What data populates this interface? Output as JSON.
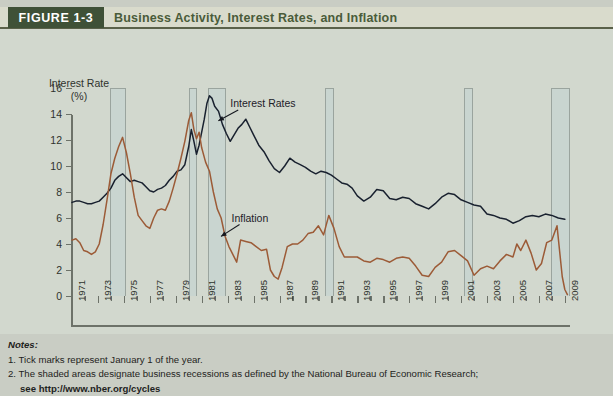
{
  "header": {
    "badge": "FIGURE 1-3",
    "title": "Business Activity, Interest Rates, and Inflation",
    "badge_bg": "#3f5137",
    "badge_fg": "#ffffff",
    "title_color": "#4a5c3a",
    "strip_bg": "#d9dbcc"
  },
  "chart_data": {
    "type": "line",
    "title": "Business Activity, Interest Rates, and Inflation",
    "xlabel": "",
    "ylabel": "Interest Rate (%)",
    "ylabel_line1": "Interest Rate",
    "ylabel_line2": "(%)",
    "ylim": [
      0,
      16
    ],
    "yticks": [
      0,
      2,
      4,
      6,
      8,
      10,
      12,
      14,
      16
    ],
    "xlim": [
      1971,
      2009.4
    ],
    "xticks": [
      1971,
      1972,
      1973,
      1974,
      1975,
      1976,
      1977,
      1978,
      1979,
      1980,
      1981,
      1982,
      1983,
      1984,
      1985,
      1986,
      1987,
      1988,
      1989,
      1990,
      1991,
      1992,
      1993,
      1994,
      1995,
      1996,
      1997,
      1998,
      1999,
      2000,
      2001,
      2002,
      2003,
      2004,
      2005,
      2006,
      2007,
      2008,
      2009
    ],
    "xticklabels": [
      "1971",
      "1973",
      "1975",
      "1977",
      "1979",
      "1981",
      "1983",
      "1985",
      "1987",
      "1989",
      "1991",
      "1993",
      "1995",
      "1997",
      "1999",
      "2001",
      "2003",
      "2005",
      "2007",
      "2009"
    ],
    "xticklabel_years": [
      1971,
      1973,
      1975,
      1977,
      1979,
      1981,
      1983,
      1985,
      1987,
      1989,
      1991,
      1993,
      1995,
      1997,
      1999,
      2001,
      2003,
      2005,
      2007,
      2009
    ],
    "grid": false,
    "legend": "annotations",
    "annotations": [
      {
        "label": "Interest Rates",
        "series": "interest_rates",
        "x_label": 1983.2,
        "y_label": 15.3,
        "x_point": 1981.9,
        "y_point": 13.1
      },
      {
        "label": "Inflation",
        "series": "inflation",
        "x_label": 1983.3,
        "y_label": 6.5,
        "x_point": 1982.1,
        "y_point": 4.2
      }
    ],
    "series": [
      {
        "name": "Interest Rates",
        "color": "#19212f",
        "x": [
          1971.0,
          1971.3,
          1971.6,
          1971.9,
          1972.2,
          1972.5,
          1972.8,
          1973.1,
          1973.4,
          1973.7,
          1974.0,
          1974.3,
          1974.6,
          1974.9,
          1975.2,
          1975.5,
          1975.8,
          1976.1,
          1976.4,
          1976.7,
          1977.0,
          1977.3,
          1977.6,
          1977.9,
          1978.2,
          1978.5,
          1978.8,
          1979.1,
          1979.4,
          1979.7,
          1980.0,
          1980.2,
          1980.4,
          1980.6,
          1980.8,
          1981.0,
          1981.2,
          1981.4,
          1981.6,
          1981.8,
          1982.0,
          1982.3,
          1982.6,
          1982.9,
          1983.2,
          1983.5,
          1983.8,
          1984.1,
          1984.4,
          1984.7,
          1985.0,
          1985.4,
          1985.8,
          1986.2,
          1986.6,
          1987.0,
          1987.4,
          1987.8,
          1988.2,
          1988.6,
          1989.0,
          1989.4,
          1989.8,
          1990.2,
          1990.6,
          1991.0,
          1991.4,
          1991.8,
          1992.2,
          1992.6,
          1993.0,
          1993.5,
          1994.0,
          1994.5,
          1995.0,
          1995.5,
          1996.0,
          1996.5,
          1997.0,
          1997.5,
          1998.0,
          1998.5,
          1999.0,
          1999.5,
          2000.0,
          2000.5,
          2001.0,
          2001.5,
          2002.0,
          2002.5,
          2003.0,
          2003.5,
          2004.0,
          2004.5,
          2005.0,
          2005.5,
          2006.0,
          2006.5,
          2007.0,
          2007.5,
          2008.0,
          2008.5,
          2009.0
        ],
        "y": [
          7.2,
          7.3,
          7.3,
          7.2,
          7.1,
          7.1,
          7.2,
          7.3,
          7.6,
          7.9,
          8.3,
          8.9,
          9.2,
          9.4,
          9.1,
          8.8,
          8.9,
          8.8,
          8.7,
          8.4,
          8.1,
          8.0,
          8.2,
          8.3,
          8.5,
          8.9,
          9.2,
          9.6,
          9.7,
          10.1,
          11.5,
          12.8,
          11.9,
          10.9,
          11.6,
          12.6,
          13.6,
          14.8,
          15.4,
          15.2,
          14.6,
          14.2,
          13.2,
          12.5,
          11.9,
          12.4,
          12.9,
          13.2,
          13.6,
          13.0,
          12.4,
          11.6,
          11.1,
          10.4,
          9.8,
          9.5,
          10.0,
          10.6,
          10.3,
          10.1,
          9.9,
          9.6,
          9.4,
          9.6,
          9.5,
          9.3,
          9.0,
          8.7,
          8.6,
          8.3,
          7.7,
          7.3,
          7.6,
          8.2,
          8.1,
          7.5,
          7.4,
          7.6,
          7.5,
          7.1,
          6.9,
          6.7,
          7.1,
          7.6,
          7.9,
          7.8,
          7.4,
          7.2,
          7.0,
          6.9,
          6.3,
          6.2,
          6.0,
          5.9,
          5.6,
          5.8,
          6.1,
          6.2,
          6.1,
          6.3,
          6.2,
          6.0,
          5.9
        ],
        "unit": "%"
      },
      {
        "name": "Inflation",
        "color": "#9c5b37",
        "x": [
          1971.0,
          1971.3,
          1971.6,
          1971.9,
          1972.2,
          1972.5,
          1972.8,
          1973.1,
          1973.4,
          1973.7,
          1974.0,
          1974.3,
          1974.6,
          1974.9,
          1975.2,
          1975.5,
          1975.8,
          1976.1,
          1976.4,
          1976.7,
          1977.0,
          1977.3,
          1977.6,
          1977.9,
          1978.2,
          1978.5,
          1978.8,
          1979.1,
          1979.4,
          1979.7,
          1980.0,
          1980.2,
          1980.4,
          1980.6,
          1980.8,
          1981.0,
          1981.3,
          1981.6,
          1981.9,
          1982.2,
          1982.5,
          1982.8,
          1983.1,
          1983.4,
          1983.7,
          1984.0,
          1984.4,
          1984.8,
          1985.2,
          1985.6,
          1986.0,
          1986.3,
          1986.6,
          1986.9,
          1987.2,
          1987.6,
          1988.0,
          1988.4,
          1988.8,
          1989.2,
          1989.6,
          1990.0,
          1990.4,
          1990.8,
          1991.2,
          1991.6,
          1992.0,
          1992.5,
          1993.0,
          1993.5,
          1994.0,
          1994.5,
          1995.0,
          1995.5,
          1996.0,
          1996.5,
          1997.0,
          1997.5,
          1998.0,
          1998.5,
          1999.0,
          1999.5,
          2000.0,
          2000.5,
          2001.0,
          2001.5,
          2002.0,
          2002.5,
          2003.0,
          2003.5,
          2004.0,
          2004.5,
          2005.0,
          2005.3,
          2005.6,
          2006.0,
          2006.4,
          2006.8,
          2007.2,
          2007.6,
          2008.0,
          2008.4,
          2008.8,
          2009.0,
          2009.2
        ],
        "y": [
          4.3,
          4.4,
          4.1,
          3.5,
          3.4,
          3.2,
          3.4,
          4.0,
          5.5,
          7.4,
          9.4,
          10.6,
          11.5,
          12.2,
          11.0,
          9.4,
          7.6,
          6.2,
          5.8,
          5.4,
          5.2,
          6.0,
          6.6,
          6.7,
          6.6,
          7.3,
          8.3,
          9.4,
          10.6,
          11.9,
          13.5,
          14.1,
          12.8,
          12.1,
          12.6,
          11.4,
          10.3,
          9.6,
          8.0,
          6.7,
          6.0,
          4.6,
          3.8,
          3.2,
          2.6,
          4.3,
          4.2,
          4.1,
          3.8,
          3.5,
          3.6,
          2.0,
          1.5,
          1.3,
          2.2,
          3.8,
          4.0,
          4.0,
          4.3,
          4.8,
          4.9,
          5.4,
          4.7,
          6.2,
          5.2,
          3.8,
          3.0,
          3.0,
          3.0,
          2.7,
          2.6,
          2.9,
          2.8,
          2.6,
          2.9,
          3.0,
          2.9,
          2.3,
          1.6,
          1.5,
          2.2,
          2.6,
          3.4,
          3.5,
          3.1,
          2.7,
          1.6,
          2.1,
          2.3,
          2.1,
          2.7,
          3.2,
          3.0,
          4.0,
          3.5,
          4.3,
          3.3,
          2.0,
          2.5,
          4.1,
          4.3,
          5.4,
          1.5,
          0.5,
          0.1
        ],
        "unit": "%"
      }
    ],
    "recessions": [
      {
        "start": 1973.9,
        "end": 1975.2
      },
      {
        "start": 1980.0,
        "end": 1980.6
      },
      {
        "start": 1981.5,
        "end": 1982.9
      },
      {
        "start": 1990.5,
        "end": 1991.2
      },
      {
        "start": 2001.2,
        "end": 2001.9
      },
      {
        "start": 2007.9,
        "end": 2009.4
      }
    ],
    "recession_fill": "#c4d4d2",
    "recession_border": "#9aa49e",
    "background": "#d2d8ce"
  },
  "notes": {
    "heading": "Notes:",
    "item1": "1. Tick marks represent January 1 of the year.",
    "item2": "2. The shaded areas designate business recessions as defined by the National Bureau of Economic Research;",
    "item2_cont": "see http://www.nber.org/cycles"
  }
}
